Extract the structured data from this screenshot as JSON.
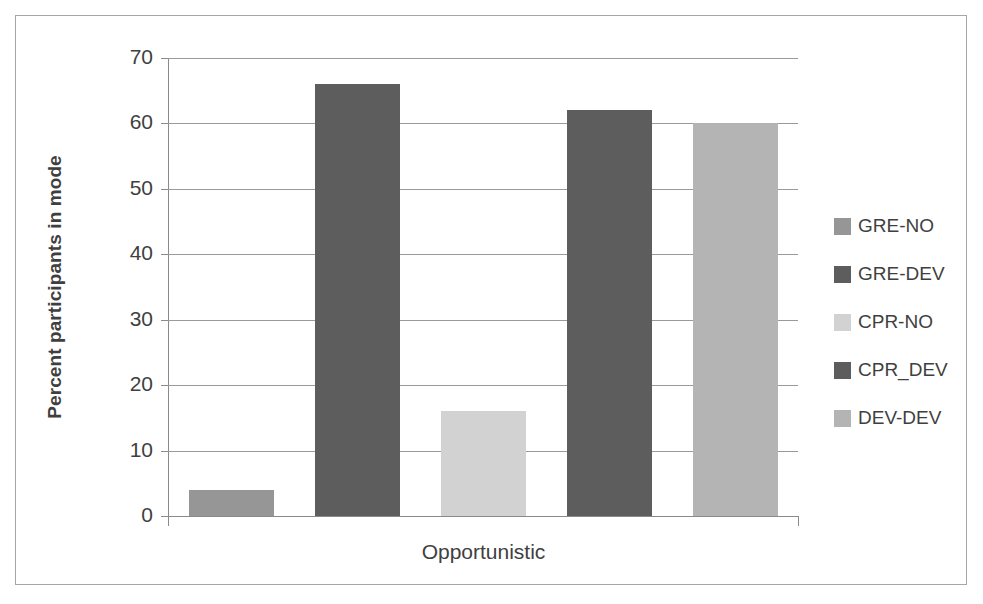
{
  "chart_data": {
    "type": "bar",
    "title": "",
    "categories": [
      "Opportunistic"
    ],
    "xlabel": "Opportunistic",
    "ylabel": "Percent participants in mode",
    "ylim": [
      0,
      70
    ],
    "ytick_step": 10,
    "yticks": [
      70,
      60,
      50,
      40,
      30,
      20,
      10,
      0
    ],
    "grid": true,
    "legend_position": "right",
    "series": [
      {
        "name": "GRE-NO",
        "values": [
          4
        ],
        "color": "#969696"
      },
      {
        "name": "GRE-DEV",
        "values": [
          66
        ],
        "color": "#5d5d5d"
      },
      {
        "name": "CPR-NO",
        "values": [
          16
        ],
        "color": "#d2d2d2"
      },
      {
        "name": "CPR_DEV",
        "values": [
          62
        ],
        "color": "#5d5d5d"
      },
      {
        "name": "DEV-DEV",
        "values": [
          60
        ],
        "color": "#b4b4b4"
      }
    ]
  },
  "axes": {
    "y_title": "Percent participants in mode",
    "x_title": "Opportunistic",
    "y_labels": {
      "t70": "70",
      "t60": "60",
      "t50": "50",
      "t40": "40",
      "t30": "30",
      "t20": "20",
      "t10": "10",
      "t0": "0"
    }
  },
  "legend": {
    "items": [
      {
        "label": "GRE-NO",
        "color": "#969696"
      },
      {
        "label": "GRE-DEV",
        "color": "#5d5d5d"
      },
      {
        "label": "CPR-NO",
        "color": "#d2d2d2"
      },
      {
        "label": "CPR_DEV",
        "color": "#5d5d5d"
      },
      {
        "label": "DEV-DEV",
        "color": "#b4b4b4"
      }
    ]
  },
  "colors": {
    "grid": "#9a9a9a",
    "axis": "#8a8a8a",
    "frame": "#a6a6a6",
    "text": "#3f3f3f",
    "background": "#ffffff"
  }
}
